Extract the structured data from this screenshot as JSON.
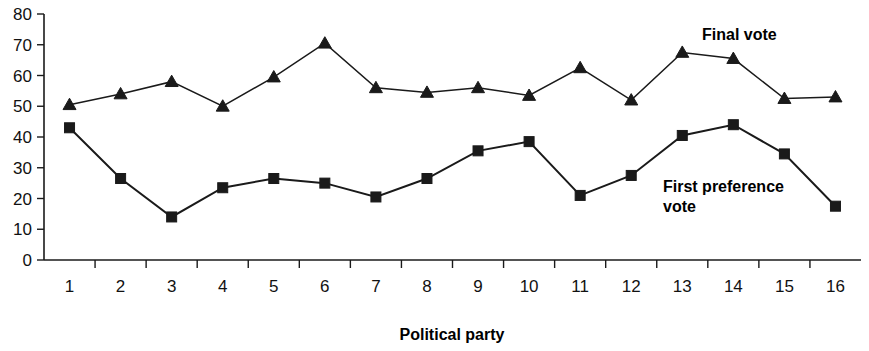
{
  "chart_data": {
    "type": "line",
    "title": "",
    "xlabel": "Political party",
    "ylabel": "",
    "categories": [
      "1",
      "2",
      "3",
      "4",
      "5",
      "6",
      "7",
      "8",
      "9",
      "10",
      "11",
      "12",
      "13",
      "14",
      "15",
      "16"
    ],
    "ylim": [
      0,
      80
    ],
    "ytick_values": [
      0,
      10,
      20,
      30,
      40,
      50,
      60,
      70,
      80
    ],
    "ytick_labels": [
      "0",
      "10",
      "20",
      "30",
      "40",
      "50",
      "60",
      "70",
      "80"
    ],
    "grid": false,
    "legend_position": "inline-annotation",
    "series": [
      {
        "name": "Final vote",
        "marker": "triangle",
        "values": [
          50.5,
          54,
          58,
          50,
          59.5,
          70.5,
          56,
          54.5,
          56,
          53.5,
          62.5,
          52,
          67.5,
          65.5,
          52.5,
          53
        ]
      },
      {
        "name": "First preference vote",
        "marker": "square",
        "values": [
          43,
          26.5,
          14,
          23.5,
          26.5,
          25,
          20.5,
          26.5,
          35.5,
          38.5,
          21,
          27.5,
          40.5,
          44,
          34.5,
          17.5
        ]
      }
    ],
    "annotations": [
      {
        "text": "Final vote",
        "x": 702,
        "y": 40
      },
      {
        "text": "First preference",
        "x": 663,
        "y": 192
      },
      {
        "text": "vote",
        "x": 663,
        "y": 212
      }
    ],
    "colors": {
      "axis": "#1a1a1a",
      "series_final_vote": "#1a1a1a",
      "series_first_preference": "#1a1a1a",
      "background": "#ffffff"
    }
  }
}
